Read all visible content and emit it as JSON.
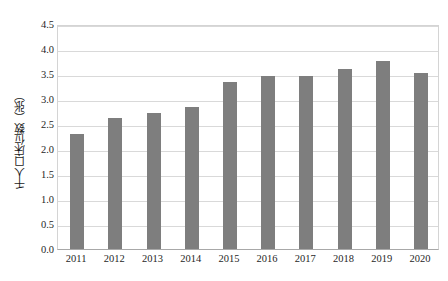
{
  "chart_data": {
    "type": "bar",
    "title": "",
    "xlabel": "",
    "ylabel": "千人口床位数（张）",
    "categories": [
      "2011",
      "2012",
      "2013",
      "2014",
      "2015",
      "2016",
      "2017",
      "2018",
      "2019",
      "2020"
    ],
    "values": [
      2.3,
      2.63,
      2.73,
      2.84,
      3.35,
      3.47,
      3.46,
      3.6,
      3.76,
      3.53
    ],
    "ylim": [
      0.0,
      4.5
    ],
    "ytick_labels": [
      "4.5",
      "4.0",
      "3.5",
      "3.0",
      "2.5",
      "2.0",
      "1.5",
      "1.0",
      "0.5",
      "0.0"
    ],
    "ytick_values": [
      4.5,
      4.0,
      3.5,
      3.0,
      2.5,
      2.0,
      1.5,
      1.0,
      0.5,
      0.0
    ],
    "grid": true,
    "legend": null,
    "series": [
      {
        "name": "千人口床位数（张）",
        "values": [
          2.3,
          2.63,
          2.73,
          2.84,
          3.35,
          3.47,
          3.46,
          3.6,
          3.76,
          3.53
        ]
      }
    ],
    "colors": {
      "bar": "#7e7e7e",
      "gridline": "#d9d9d9",
      "axis": "#a8a8a8",
      "text": "#1f1f1f",
      "background": "#ffffff"
    }
  }
}
